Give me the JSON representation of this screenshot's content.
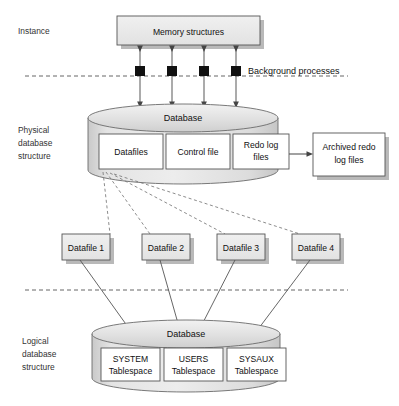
{
  "diagram": {
    "colors": {
      "box_fill": "#e9e9e9",
      "box_fill_white": "#ffffff",
      "box_stroke": "#555555",
      "shadow": "#b9b9b9",
      "cyl_top": "#e6e6e6",
      "cyl_body": "#dcdcdc",
      "line": "#555555",
      "dash": "#555555",
      "process_square": "#111111",
      "text": "#111111"
    },
    "sections": [
      {
        "id": "instance",
        "label": "Instance",
        "label_lines": [
          "Instance"
        ]
      },
      {
        "id": "physical",
        "label": "Physical database structure",
        "label_lines": [
          "Physical",
          "database",
          "structure"
        ]
      },
      {
        "id": "logical",
        "label": "Logical database structure",
        "label_lines": [
          "Logical",
          "database",
          "structure"
        ]
      }
    ],
    "instance": {
      "memory_box": {
        "label": "Memory structures"
      },
      "background_processes": {
        "label": "Background processes",
        "count": 4
      }
    },
    "physical": {
      "cylinder_label": "Database",
      "components": [
        {
          "id": "datafiles",
          "label": "Datafiles",
          "lines": [
            "Datafiles"
          ]
        },
        {
          "id": "control-file",
          "label": "Control file",
          "lines": [
            "Control file"
          ]
        },
        {
          "id": "redo-log-files",
          "label": "Redo log files",
          "lines": [
            "Redo log",
            "files"
          ]
        }
      ],
      "archived": {
        "id": "archived-redo-log-files",
        "label": "Archived redo log files",
        "lines": [
          "Archived redo",
          "log files"
        ]
      }
    },
    "datafiles": [
      {
        "id": "datafile-1",
        "label": "Datafile 1"
      },
      {
        "id": "datafile-2",
        "label": "Datafile 2"
      },
      {
        "id": "datafile-3",
        "label": "Datafile 3"
      },
      {
        "id": "datafile-4",
        "label": "Datafile 4"
      }
    ],
    "logical": {
      "cylinder_label": "Database",
      "tablespaces": [
        {
          "id": "system-tablespace",
          "name": "SYSTEM",
          "type": "Tablespace",
          "lines": [
            "SYSTEM",
            "Tablespace"
          ]
        },
        {
          "id": "users-tablespace",
          "name": "USERS",
          "type": "Tablespace",
          "lines": [
            "USERS",
            "Tablespace"
          ]
        },
        {
          "id": "sysaux-tablespace",
          "name": "SYSAUX",
          "type": "Tablespace",
          "lines": [
            "SYSAUX",
            "Tablespace"
          ]
        }
      ]
    }
  }
}
